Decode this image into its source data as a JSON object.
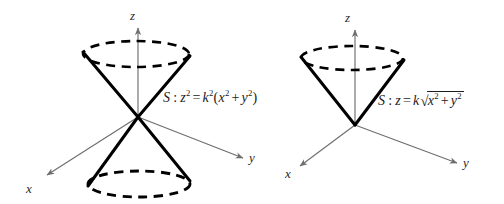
{
  "figure": {
    "background_color": "#ffffff",
    "axis_color": "#6e6e6e",
    "cone_color": "#000000",
    "text_color": "#1c1c1c"
  },
  "diagrams": [
    {
      "name": "double-cone",
      "equation": {
        "surface": "S",
        "colon": ":",
        "lhs_var": "z",
        "lhs_exp": "2",
        "equals": "=",
        "coef_var": "k",
        "coef_exp": "2",
        "open_paren": "(",
        "term1_var": "x",
        "term1_exp": "2",
        "plus": "+",
        "term2_var": "y",
        "term2_exp": "2",
        "close_paren": ")",
        "plain": "S : z^2 = k^2(x^2 + y^2)"
      },
      "axes": [
        {
          "name": "z",
          "label": "z"
        },
        {
          "name": "x",
          "label": "x"
        },
        {
          "name": "y",
          "label": "y"
        }
      ]
    },
    {
      "name": "single-cone",
      "equation": {
        "surface": "S",
        "colon": ":",
        "lhs_var": "z",
        "equals": "=",
        "coef_var": "k",
        "radical_sign": "√",
        "term1_var": "x",
        "term1_exp": "2",
        "plus": "+",
        "term2_var": "y",
        "term2_exp": "2",
        "plain": "S : z = k sqrt(x^2 + y^2)"
      },
      "axes": [
        {
          "name": "z",
          "label": "z"
        },
        {
          "name": "x",
          "label": "x"
        },
        {
          "name": "y",
          "label": "y"
        }
      ]
    }
  ]
}
